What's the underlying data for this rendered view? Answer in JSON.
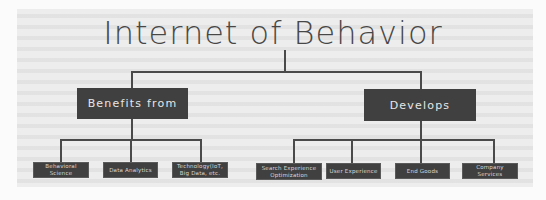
{
  "diagram": {
    "title": "Internet of Behavior",
    "branches": [
      {
        "label": "Benefits from",
        "children": [
          {
            "label": "Behavioral Science"
          },
          {
            "label": "Data Analytics"
          },
          {
            "label": "Technology(IoT, Big Data, etc."
          }
        ]
      },
      {
        "label": "Develops",
        "children": [
          {
            "label": "Search Experience Optimization"
          },
          {
            "label": "User Experience"
          },
          {
            "label": "End Goods"
          },
          {
            "label": "Company Services"
          }
        ]
      }
    ],
    "colors": {
      "background": "#ededed",
      "box_fill": "#404040",
      "box_text": "#e6e6e6",
      "connector": "#4a4a4a",
      "title_text": "#474747"
    }
  }
}
